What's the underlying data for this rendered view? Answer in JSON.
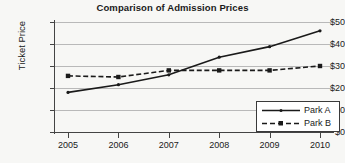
{
  "chart_data": {
    "type": "line",
    "title": "Comparison of Admission Prices",
    "xlabel": "",
    "ylabel": "Ticket Price",
    "categories": [
      "2005",
      "2006",
      "2007",
      "2008",
      "2009",
      "2010"
    ],
    "x": [
      2005,
      2006,
      2007,
      2008,
      2009,
      2010
    ],
    "ylim": [
      0,
      50
    ],
    "ytick_labels": [
      "$0",
      "$10",
      "$20",
      "$30",
      "$40",
      "$50"
    ],
    "ytick_values": [
      0,
      10,
      20,
      30,
      40,
      50
    ],
    "grid": "horizontal",
    "legend_position": "bottom-right",
    "series": [
      {
        "name": "Park A",
        "values": [
          18,
          21.5,
          26,
          34,
          38.8,
          46
        ],
        "line_style": "solid",
        "marker": "dot",
        "color": "#1a1a1a"
      },
      {
        "name": "Park B",
        "values": [
          25.5,
          25,
          28,
          28,
          28,
          30
        ],
        "line_style": "dashed",
        "marker": "square",
        "color": "#1a1a1a"
      }
    ]
  },
  "legend": {
    "items": [
      {
        "label": "Park A"
      },
      {
        "label": "Park B"
      }
    ]
  },
  "colors": {
    "background": "#f7f7f5",
    "axis": "#444444",
    "grid": "#b9b9b9",
    "text": "#1a1a1a",
    "legend_background": "#ffffff",
    "legend_border": "#3a3a3a"
  }
}
